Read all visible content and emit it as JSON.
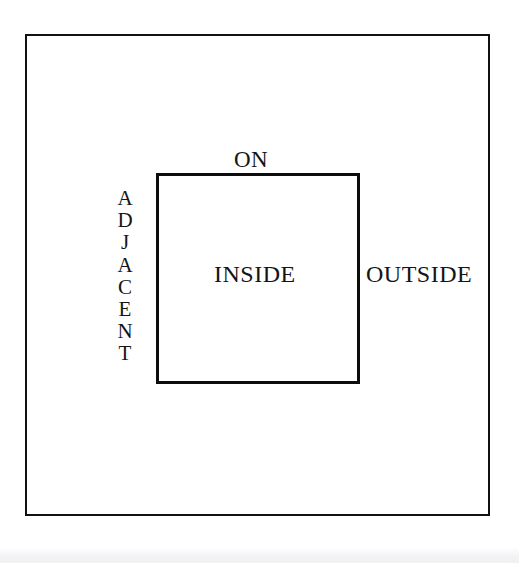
{
  "figure": {
    "title": "",
    "background_color": "#ffffff",
    "line_color": "#111111",
    "text_color": "#151515"
  },
  "shapes": {
    "outer_rect": {
      "name": "outer-boundary-rectangle",
      "x": 25,
      "y": 34,
      "width": 465,
      "height": 482,
      "stroke_width": 2
    },
    "inner_rect": {
      "name": "inner-region-square",
      "x": 156,
      "y": 173,
      "width": 204,
      "height": 211,
      "stroke_width": 3
    }
  },
  "labels": {
    "on": "ON",
    "inside": "INSIDE",
    "outside": "OUTSIDE",
    "adjacent": "ADJACENT",
    "adjacent_letters": [
      "A",
      "D",
      "J",
      "A",
      "C",
      "E",
      "N",
      "T"
    ]
  }
}
